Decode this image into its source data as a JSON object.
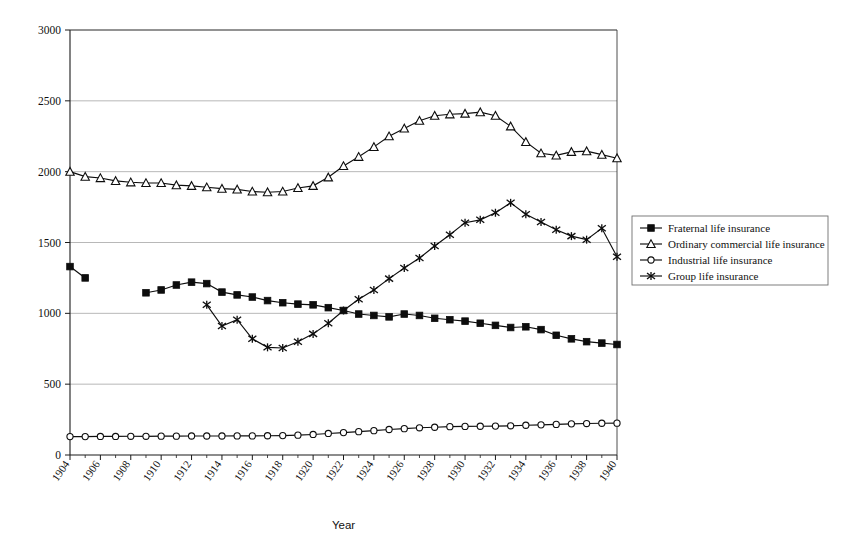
{
  "chart_data": {
    "type": "line",
    "title": "",
    "xlabel": "Year",
    "ylabel": "",
    "xlim": [
      1904,
      1940
    ],
    "ylim": [
      0,
      3000
    ],
    "ytick_values": [
      0,
      500,
      1000,
      1500,
      2000,
      2500,
      3000
    ],
    "ytick_labels": [
      "0",
      "500",
      "1000",
      "1500",
      "2000",
      "2500",
      "3000"
    ],
    "xtick_values": [
      1904,
      1906,
      1908,
      1910,
      1912,
      1914,
      1916,
      1918,
      1920,
      1922,
      1924,
      1926,
      1928,
      1930,
      1932,
      1934,
      1936,
      1938,
      1940
    ],
    "xtick_labels": [
      "1904",
      "1906",
      "1908",
      "1910",
      "1912",
      "1914",
      "1916",
      "1918",
      "1920",
      "1922",
      "1924",
      "1926",
      "1928",
      "1930",
      "1932",
      "1934",
      "1936",
      "1938",
      "1940"
    ],
    "xtick_minor_step": 1,
    "grid": "horizontal",
    "legend_position": "right",
    "series": [
      {
        "name": "Fraternal life insurance",
        "marker": "filled-square",
        "x": [
          1904,
          1905,
          1909,
          1910,
          1911,
          1912,
          1913,
          1914,
          1915,
          1916,
          1917,
          1918,
          1919,
          1920,
          1921,
          1922,
          1923,
          1924,
          1925,
          1926,
          1927,
          1928,
          1929,
          1930,
          1931,
          1932,
          1933,
          1934,
          1935,
          1936,
          1937,
          1938,
          1939,
          1940
        ],
        "values": [
          1330,
          1250,
          1145,
          1165,
          1200,
          1220,
          1210,
          1150,
          1130,
          1115,
          1090,
          1075,
          1065,
          1060,
          1040,
          1020,
          995,
          985,
          975,
          995,
          985,
          965,
          955,
          945,
          930,
          915,
          900,
          905,
          885,
          845,
          820,
          800,
          790,
          780
        ]
      },
      {
        "name": "Ordinary commercial life insurance",
        "marker": "open-triangle",
        "x": [
          1904,
          1905,
          1906,
          1907,
          1908,
          1909,
          1910,
          1911,
          1912,
          1913,
          1914,
          1915,
          1916,
          1917,
          1918,
          1919,
          1920,
          1921,
          1922,
          1923,
          1924,
          1925,
          1926,
          1927,
          1928,
          1929,
          1930,
          1931,
          1932,
          1933,
          1934,
          1935,
          1936,
          1937,
          1938,
          1939,
          1940
        ],
        "values": [
          2000,
          1965,
          1955,
          1935,
          1925,
          1920,
          1920,
          1905,
          1900,
          1890,
          1880,
          1875,
          1860,
          1855,
          1860,
          1885,
          1900,
          1960,
          2040,
          2105,
          2175,
          2250,
          2305,
          2360,
          2395,
          2405,
          2410,
          2420,
          2395,
          2320,
          2210,
          2130,
          2115,
          2140,
          2145,
          2120,
          2095
        ]
      },
      {
        "name": "Industrial life insurance",
        "marker": "open-circle",
        "x": [
          1904,
          1905,
          1906,
          1907,
          1908,
          1909,
          1910,
          1911,
          1912,
          1913,
          1914,
          1915,
          1916,
          1917,
          1918,
          1919,
          1920,
          1921,
          1922,
          1923,
          1924,
          1925,
          1926,
          1927,
          1928,
          1929,
          1930,
          1931,
          1932,
          1933,
          1934,
          1935,
          1936,
          1937,
          1938,
          1939,
          1940
        ],
        "values": [
          130,
          130,
          131,
          131,
          132,
          132,
          133,
          133,
          134,
          134,
          134,
          135,
          135,
          136,
          137,
          140,
          145,
          152,
          158,
          165,
          172,
          180,
          186,
          192,
          196,
          200,
          202,
          203,
          204,
          206,
          210,
          213,
          216,
          220,
          222,
          224,
          225
        ]
      },
      {
        "name": "Group life insurance",
        "marker": "star",
        "x": [
          1913,
          1914,
          1915,
          1916,
          1917,
          1918,
          1919,
          1920,
          1921,
          1922,
          1923,
          1924,
          1925,
          1926,
          1927,
          1928,
          1929,
          1930,
          1931,
          1932,
          1933,
          1934,
          1935,
          1936,
          1937,
          1938,
          1939,
          1940
        ],
        "values": [
          1060,
          910,
          955,
          820,
          760,
          755,
          800,
          855,
          930,
          1020,
          1100,
          1165,
          1245,
          1320,
          1390,
          1475,
          1555,
          1640,
          1660,
          1710,
          1780,
          1700,
          1645,
          1590,
          1545,
          1520,
          1600,
          1400
        ]
      }
    ]
  },
  "legend": {
    "items": [
      {
        "label": "Fraternal life insurance",
        "marker": "filled-square"
      },
      {
        "label": "Ordinary commercial life insurance",
        "marker": "open-triangle"
      },
      {
        "label": "Industrial life insurance",
        "marker": "open-circle"
      },
      {
        "label": "Group life insurance",
        "marker": "star"
      }
    ]
  }
}
